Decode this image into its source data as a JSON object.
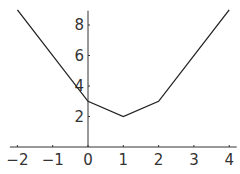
{
  "chart_data": {
    "type": "line",
    "title": "",
    "xlabel": "",
    "ylabel": "",
    "x": [
      -2,
      0,
      1,
      2,
      4
    ],
    "values": [
      9,
      3,
      2,
      3,
      9
    ],
    "series": [
      {
        "name": "y",
        "x": [
          -2,
          0,
          1,
          2,
          4
        ],
        "values": [
          9,
          3,
          2,
          3,
          9
        ]
      }
    ],
    "xlim": [
      -2.1,
      4.1
    ],
    "ylim": [
      0,
      9.2
    ],
    "x_ticks": [
      -2,
      -1,
      0,
      1,
      2,
      3,
      4
    ],
    "y_ticks": [
      2,
      4,
      6,
      8
    ],
    "x_tick_labels": [
      "−2",
      "−1",
      "0",
      "1",
      "2",
      "3",
      "4"
    ],
    "y_tick_labels": [
      "2",
      "4",
      "6",
      "8"
    ],
    "grid": false,
    "legend": null
  }
}
